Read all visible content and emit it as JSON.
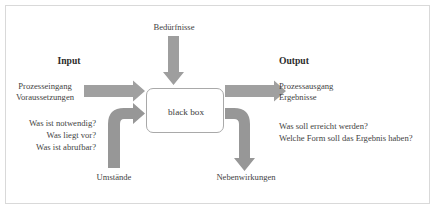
{
  "diagram": {
    "title_center_box": "black box",
    "top": {
      "label": "Bedürfnisse"
    },
    "input": {
      "heading": "Input",
      "terms": [
        "Prozesseingang",
        "Voraussetzungen"
      ],
      "questions": [
        "Was ist notwendig?",
        "Was liegt vor?",
        "Was ist abrufbar?"
      ]
    },
    "output": {
      "heading": "Output",
      "terms": [
        "Prozessausgang",
        "Ergebnisse"
      ],
      "questions": [
        "Was soll erreicht werden?",
        "Welche Form soll das Ergebnis haben?"
      ]
    },
    "bottom_left": {
      "label": "Umstände"
    },
    "bottom_right": {
      "label": "Nebenwirkungen"
    },
    "colors": {
      "arrow_gray": "#9a9a9a",
      "arrow_gray_light": "#a8a8a8",
      "box_border": "#a9a9a9",
      "frame_border": "#d9d9d9",
      "text": "#434343",
      "background": "#ffffff"
    }
  }
}
